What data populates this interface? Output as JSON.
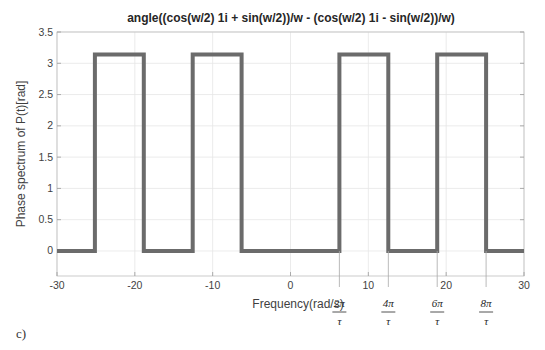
{
  "chart_data": {
    "type": "line",
    "title": "angle((cos(w/2) 1i + sin(w/2))/w - (cos(w/2) 1i - sin(w/2))/w)",
    "xlabel": "Frequency(rad/s)",
    "ylabel": "Phase spectrum of P(t)[rad]",
    "xlim": [
      -30,
      30
    ],
    "ylim": [
      -0.4,
      3.5
    ],
    "xticks": [
      -30,
      -20,
      -10,
      0,
      10,
      20,
      30
    ],
    "xtick_labels": [
      "-30",
      "-20",
      "-10",
      "0",
      "10",
      "20",
      "30"
    ],
    "yticks": [
      0,
      0.5,
      1,
      1.5,
      2,
      2.5,
      3,
      3.5
    ],
    "ytick_labels": [
      "0",
      "0.5",
      "1",
      "1.5",
      "2",
      "2.5",
      "3",
      "3.5"
    ],
    "grid": true,
    "series": [
      {
        "name": "phase",
        "color": "#6b6b6b",
        "step_edges": [
          -30,
          -25.13,
          -18.85,
          -12.57,
          -6.28,
          6.28,
          12.57,
          18.85,
          25.13,
          30
        ],
        "x": [
          -30,
          -25.13,
          -25.13,
          -18.85,
          -18.85,
          -12.57,
          -12.57,
          -6.28,
          -6.28,
          6.28,
          6.28,
          12.57,
          12.57,
          18.85,
          18.85,
          25.13,
          25.13,
          30
        ],
        "y": [
          0,
          0,
          3.1416,
          3.1416,
          0,
          0,
          3.1416,
          3.1416,
          0,
          0,
          3.1416,
          3.1416,
          0,
          0,
          3.1416,
          3.1416,
          0,
          0
        ]
      }
    ],
    "annotations": [
      {
        "x": 6.28,
        "numerator": "2π",
        "denominator": "τ"
      },
      {
        "x": 12.57,
        "numerator": "4π",
        "denominator": "τ"
      },
      {
        "x": 18.85,
        "numerator": "6π",
        "denominator": "τ"
      },
      {
        "x": 25.13,
        "numerator": "8π",
        "denominator": "τ"
      }
    ],
    "panel_label": "c)"
  }
}
